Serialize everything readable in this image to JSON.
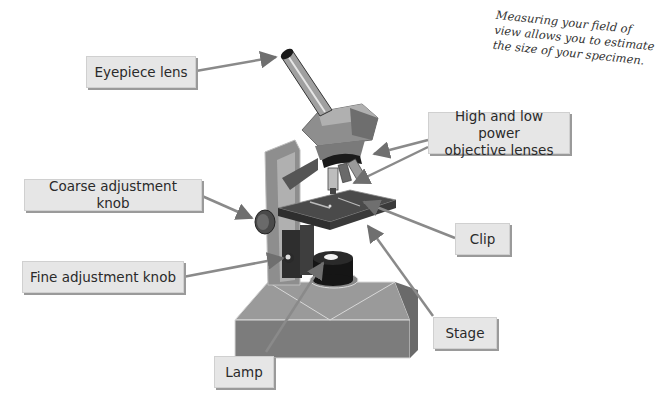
{
  "note": {
    "lines": [
      "Measuring your field of",
      "view allows you to estimate",
      "the size of your specimen."
    ]
  },
  "labels": {
    "eyepiece": "Eyepiece lens",
    "objective_line1": "High and low power",
    "objective_line2": "objective lenses",
    "coarse": "Coarse adjustment knob",
    "fine": "Fine adjustment knob",
    "clip": "Clip",
    "stage": "Stage",
    "lamp": "Lamp"
  },
  "colors": {
    "label_bg": "#e6e6e6",
    "label_shadow": "#9a9a9a",
    "microscope_body": "#8c8c8c",
    "microscope_dark": "#3a3a3a",
    "stage": "#4a4a4a",
    "pointer": "#8a8a8a"
  }
}
